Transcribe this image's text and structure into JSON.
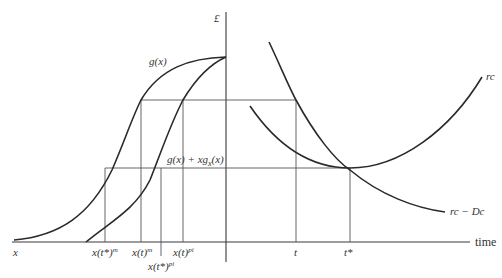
{
  "diagram": {
    "y_axis_label": "£",
    "x_axis_label": "time",
    "origin_label": "x",
    "curves": {
      "g": "g(x)",
      "g_plus": "g(x) + xg",
      "g_plus_sub": "x",
      "g_plus_tail": "(x)",
      "rc": "rc",
      "rc_minus_dc": "rc − Dc"
    },
    "x_ticks": {
      "xtstar_m": "x(t*)",
      "xtstar_m_sup": "m",
      "xt_m": "x(t)",
      "xt_m_sup": "m",
      "xtstar_pi": "x(t*)",
      "xtstar_pi_sup": "pi",
      "xt_pi": "x(t)",
      "xt_pi_sup": "pi",
      "t": "t",
      "tstar": "t*"
    }
  }
}
